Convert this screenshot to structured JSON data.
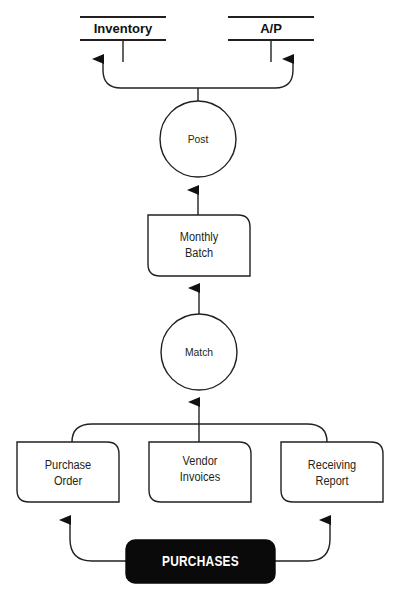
{
  "diagram": {
    "type": "data-flow-diagram",
    "colors": {
      "stroke": "#231f20",
      "entity_fill": "#0a0a0a",
      "entity_text": "#ffffff",
      "background": "#ffffff"
    },
    "data_stores": [
      {
        "id": "inventory",
        "label": "Inventory"
      },
      {
        "id": "ap",
        "label": "A/P"
      }
    ],
    "processes": [
      {
        "id": "post",
        "label": "Post"
      },
      {
        "id": "match",
        "label": "Match"
      }
    ],
    "documents": [
      {
        "id": "monthly-batch",
        "label": "Monthly\nBatch"
      },
      {
        "id": "purchase-order",
        "label": "Purchase\nOrder"
      },
      {
        "id": "vendor-invoices",
        "label": "Vendor\nInvoices"
      },
      {
        "id": "receiving-report",
        "label": "Receiving\nReport"
      }
    ],
    "external_entities": [
      {
        "id": "purchases",
        "label": "PURCHASES"
      }
    ],
    "flows": [
      {
        "from": "purchases",
        "to": "purchase-order"
      },
      {
        "from": "purchases",
        "to": "receiving-report"
      },
      {
        "from": "purchase-order",
        "to": "match"
      },
      {
        "from": "vendor-invoices",
        "to": "match"
      },
      {
        "from": "receiving-report",
        "to": "match"
      },
      {
        "from": "match",
        "to": "monthly-batch"
      },
      {
        "from": "monthly-batch",
        "to": "post"
      },
      {
        "from": "post",
        "to": "inventory"
      },
      {
        "from": "post",
        "to": "ap"
      }
    ]
  }
}
